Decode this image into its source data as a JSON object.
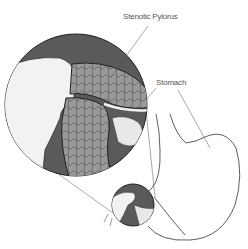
{
  "figure": {
    "labels": {
      "pylorus": "Stenotic Pylorus",
      "stomach": "Stomach"
    },
    "colors": {
      "background": "#ffffff",
      "magnified_bg": "#5a5a5a",
      "muscle": "#9a9a9a",
      "line": "#333333",
      "label_text": "#555555"
    }
  }
}
